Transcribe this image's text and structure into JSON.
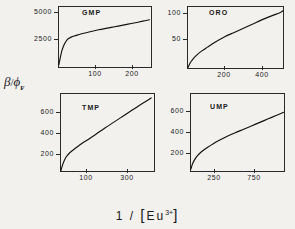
{
  "figure": {
    "ylabel_main": "β",
    "ylabel_slash": "/",
    "ylabel_phi": "ϕ",
    "ylabel_sub": "F",
    "xlabel_pre": "1  /  ",
    "xlabel_open": "[",
    "xlabel_elem": "Eu",
    "xlabel_sup": "3+",
    "xlabel_close": "]",
    "background_color": "#f2f1ee",
    "line_color": "#111111",
    "axis_color": "#2a2a2a"
  },
  "chart_data": [
    {
      "type": "line",
      "title": "GMP",
      "xlabel": "1 / [Eu3+]",
      "ylabel": "beta/phi_F",
      "xlim": [
        0,
        255
      ],
      "ylim": [
        0,
        5600
      ],
      "xticks": [
        100,
        200
      ],
      "xtick_labels": [
        "100",
        "200"
      ],
      "yticks": [
        2500,
        5000
      ],
      "ytick_labels": [
        "2500",
        "5000"
      ],
      "grid": false,
      "legend": "none",
      "x": [
        2,
        6,
        10,
        14,
        18,
        22,
        26,
        30,
        36,
        44,
        55,
        70,
        90,
        110,
        130,
        150,
        170,
        190,
        210,
        230,
        248
      ],
      "y": [
        250,
        900,
        1500,
        1900,
        2200,
        2420,
        2580,
        2680,
        2790,
        2890,
        3000,
        3140,
        3300,
        3450,
        3580,
        3700,
        3830,
        3960,
        4090,
        4230,
        4360
      ]
    },
    {
      "type": "line",
      "title": "ORO",
      "xlabel": "1 / [Eu3+]",
      "ylabel": "beta/phi_F",
      "xlim": [
        0,
        520
      ],
      "ylim": [
        0,
        118
      ],
      "xticks": [
        200,
        400
      ],
      "xtick_labels": [
        "200",
        "400"
      ],
      "yticks": [
        50,
        100
      ],
      "ytick_labels": [
        "50",
        "100"
      ],
      "grid": false,
      "legend": "none",
      "x": [
        5,
        12,
        22,
        35,
        55,
        80,
        110,
        150,
        200,
        250,
        300,
        350,
        400,
        450,
        500,
        515
      ],
      "y": [
        3,
        8,
        14,
        20,
        27,
        34,
        41,
        50,
        60,
        68,
        76,
        84,
        92,
        99,
        106,
        109
      ]
    },
    {
      "type": "line",
      "title": "TMP",
      "xlabel": "1 / [Eu3+]",
      "ylabel": "beta/phi_F",
      "xlim": [
        0,
        370
      ],
      "ylim": [
        0,
        800
      ],
      "xticks": [
        100,
        300
      ],
      "xtick_labels": [
        "100",
        "300"
      ],
      "yticks": [
        200,
        400,
        600
      ],
      "ytick_labels": [
        "200",
        "400",
        "600"
      ],
      "grid": false,
      "legend": "none",
      "x": [
        3,
        8,
        14,
        20,
        28,
        38,
        50,
        65,
        85,
        110,
        140,
        175,
        210,
        245,
        280,
        310,
        340,
        355
      ],
      "y": [
        10,
        55,
        100,
        135,
        165,
        195,
        220,
        250,
        288,
        330,
        382,
        445,
        505,
        565,
        625,
        675,
        725,
        750
      ]
    },
    {
      "type": "line",
      "title": "UMP",
      "xlabel": "1 / [Eu3+]",
      "ylabel": "beta/phi_F",
      "xlim": [
        0,
        1020
      ],
      "ylim": [
        0,
        780
      ],
      "xticks": [
        250,
        750
      ],
      "xtick_labels": [
        "250",
        "750"
      ],
      "yticks": [
        200,
        400,
        600
      ],
      "ytick_labels": [
        "200",
        "400",
        "600"
      ],
      "grid": false,
      "legend": "none",
      "x": [
        10,
        25,
        45,
        70,
        100,
        140,
        190,
        250,
        320,
        400,
        480,
        570,
        660,
        750,
        840,
        930,
        1005
      ],
      "y": [
        30,
        75,
        115,
        150,
        180,
        212,
        245,
        280,
        315,
        352,
        385,
        420,
        455,
        490,
        525,
        560,
        590
      ]
    }
  ],
  "panels": [
    {
      "label": "GMP",
      "index": 0
    },
    {
      "label": "ORO",
      "index": 1
    },
    {
      "label": "TMP",
      "index": 2
    },
    {
      "label": "UMP",
      "index": 3
    }
  ]
}
